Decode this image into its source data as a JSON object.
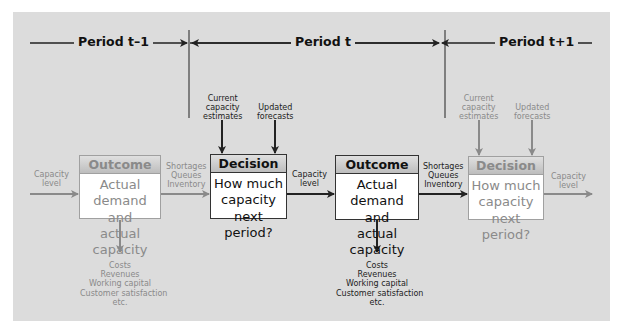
{
  "periods": {
    "prev": "Period t–1",
    "current": "Period t",
    "next": "Period t+1"
  },
  "boxes": {
    "outcome_prev": {
      "title": "Outcome",
      "body": [
        "Actual demand",
        "and",
        "actual capacity"
      ],
      "style": "faded"
    },
    "decision_current": {
      "title": "Decision",
      "body": [
        "How much",
        "capacity",
        "next period?"
      ],
      "style": "dark"
    },
    "outcome_current": {
      "title": "Outcome",
      "body": [
        "Actual demand",
        "and",
        "actual capacity"
      ],
      "style": "dark"
    },
    "decision_next": {
      "title": "Decision",
      "body": [
        "How much",
        "capacity",
        "next period?"
      ],
      "style": "faded"
    }
  },
  "labels": {
    "capacity_level_in": [
      "Capacity",
      "level"
    ],
    "shortages_prev": [
      "Shortages",
      "Queues",
      "Inventory"
    ],
    "current_estimates": [
      "Current",
      "capacity",
      "estimates"
    ],
    "updated_forecasts": [
      "Updated",
      "forecasts"
    ],
    "capacity_level_mid": [
      "Capacity",
      "level"
    ],
    "shortages_current": [
      "Shortages",
      "Queues",
      "Inventory"
    ],
    "current_estimates_next": [
      "Current",
      "capacity",
      "estimates"
    ],
    "updated_forecasts_next": [
      "Updated",
      "forecasts"
    ],
    "capacity_level_out": [
      "Capacity",
      "level"
    ],
    "results_prev": [
      "Costs",
      "Revenues",
      "Working capital",
      "Customer satisfaction",
      "etc."
    ],
    "results_current": [
      "Costs",
      "Revenues",
      "Working capital",
      "Customer satisfaction",
      "etc."
    ]
  },
  "colors": {
    "background": "#dcdcdc",
    "dark": "#222222",
    "faded": "#8a8a8a"
  }
}
